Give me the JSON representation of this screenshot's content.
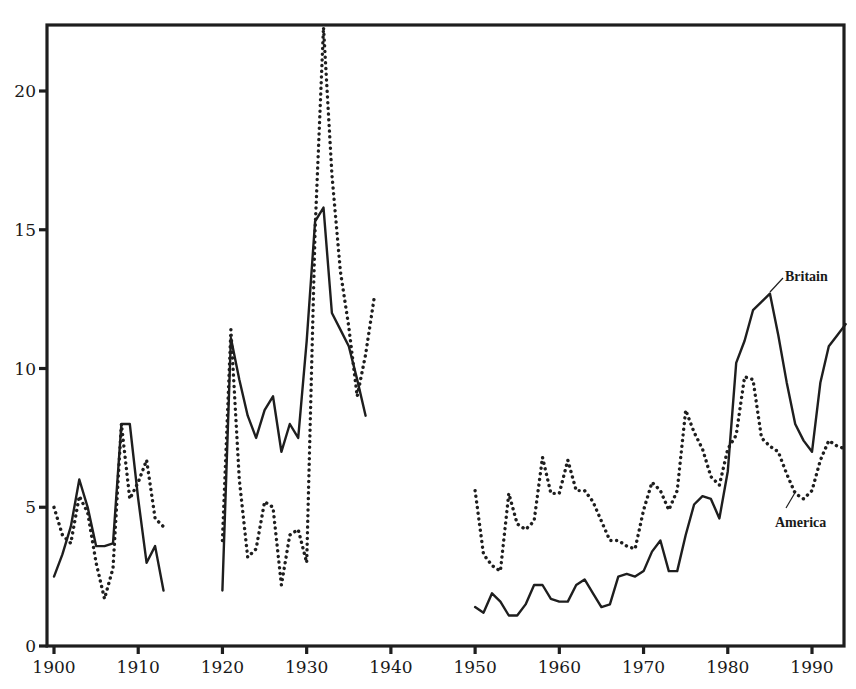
{
  "chart_data": {
    "type": "line",
    "title": "",
    "xlabel": "",
    "ylabel": "",
    "xlim": [
      1900,
      1994
    ],
    "ylim": [
      0,
      22.4
    ],
    "grid": false,
    "legend_position": "inline labels at right",
    "x_ticks": [
      1900,
      1910,
      1920,
      1930,
      1940,
      1950,
      1960,
      1970,
      1980,
      1990
    ],
    "x_tick_labels": [
      "1900",
      "1910",
      "1920",
      "1930",
      "1940",
      "1950",
      "1960",
      "1970",
      "1980",
      "1990"
    ],
    "y_ticks": [
      0,
      5,
      10,
      15,
      20
    ],
    "y_tick_labels": [
      "0",
      "5",
      "10",
      "15",
      "20"
    ],
    "series": [
      {
        "name": "Britain",
        "style": "solid",
        "label": "Britain",
        "segments": [
          {
            "x": [
              1900,
              1901,
              1902,
              1903,
              1904,
              1905,
              1906,
              1907,
              1908,
              1909,
              1910,
              1911,
              1912,
              1913
            ],
            "values": [
              2.5,
              3.3,
              4.3,
              6.0,
              5.0,
              3.6,
              3.6,
              3.7,
              8.0,
              8.0,
              5.3,
              3.0,
              3.6,
              2.0
            ]
          },
          {
            "x": [
              1920,
              1921,
              1922,
              1923,
              1924,
              1925,
              1926,
              1927,
              1928,
              1929,
              1930,
              1931,
              1932,
              1933,
              1934,
              1935,
              1936,
              1937
            ],
            "values": [
              2.0,
              11.1,
              9.6,
              8.3,
              7.5,
              8.5,
              9.0,
              7.0,
              8.0,
              7.5,
              11.0,
              15.3,
              15.8,
              12.0,
              11.4,
              10.8,
              9.6,
              8.3
            ]
          },
          {
            "x": [
              1950,
              1951,
              1952,
              1953,
              1954,
              1955,
              1956,
              1957,
              1958,
              1959,
              1960,
              1961,
              1962,
              1963,
              1964,
              1965,
              1966,
              1967,
              1968,
              1969,
              1970,
              1971,
              1972,
              1973,
              1974,
              1975,
              1976,
              1977,
              1978,
              1979,
              1980,
              1981,
              1982,
              1983,
              1984,
              1985,
              1986,
              1987,
              1988,
              1989,
              1990,
              1991,
              1992,
              1993,
              1994
            ],
            "values": [
              1.4,
              1.2,
              1.9,
              1.6,
              1.1,
              1.1,
              1.5,
              2.2,
              2.2,
              1.7,
              1.6,
              1.6,
              2.2,
              2.4,
              1.9,
              1.4,
              1.5,
              2.5,
              2.6,
              2.5,
              2.7,
              3.4,
              3.8,
              2.7,
              2.7,
              4.0,
              5.1,
              5.4,
              5.3,
              4.6,
              6.3,
              10.2,
              11.0,
              12.1,
              12.4,
              12.7,
              11.2,
              9.5,
              8.0,
              7.4,
              7.0,
              9.5,
              10.8,
              11.2,
              11.6
            ]
          }
        ]
      },
      {
        "name": "America",
        "style": "dotted",
        "label": "America",
        "segments": [
          {
            "x": [
              1900,
              1901,
              1902,
              1903,
              1904,
              1905,
              1906,
              1907,
              1908,
              1909,
              1910,
              1911,
              1912,
              1913
            ],
            "values": [
              5.0,
              4.0,
              3.7,
              5.4,
              4.8,
              3.0,
              1.7,
              2.8,
              8.0,
              5.3,
              5.9,
              6.7,
              4.6,
              4.3
            ]
          },
          {
            "x": [
              1920,
              1921,
              1922,
              1923,
              1924,
              1925,
              1926,
              1927,
              1928,
              1929,
              1930,
              1931,
              1932,
              1933,
              1934,
              1935,
              1936,
              1937,
              1938
            ],
            "values": [
              3.8,
              11.4,
              6.0,
              3.2,
              3.5,
              5.2,
              5.0,
              2.2,
              4.0,
              4.2,
              3.0,
              15.0,
              22.3,
              17.0,
              13.5,
              11.5,
              9.0,
              10.5,
              12.5
            ]
          },
          {
            "x": [
              1950,
              1951,
              1952,
              1953,
              1954,
              1955,
              1956,
              1957,
              1958,
              1959,
              1960,
              1961,
              1962,
              1963,
              1964,
              1965,
              1966,
              1967,
              1968,
              1969,
              1970,
              1971,
              1972,
              1973,
              1974,
              1975,
              1976,
              1977,
              1978,
              1979,
              1980,
              1981,
              1982,
              1983,
              1984,
              1985,
              1986,
              1987,
              1988,
              1989,
              1990,
              1991,
              1992,
              1993,
              1994
            ],
            "values": [
              5.6,
              3.3,
              2.9,
              2.7,
              5.5,
              4.4,
              4.2,
              4.5,
              6.8,
              5.5,
              5.5,
              6.7,
              5.6,
              5.6,
              5.2,
              4.5,
              3.8,
              3.8,
              3.6,
              3.5,
              4.9,
              5.9,
              5.6,
              4.9,
              5.6,
              8.5,
              7.7,
              7.1,
              6.1,
              5.8,
              7.1,
              7.6,
              9.7,
              9.6,
              7.5,
              7.2,
              7.0,
              6.2,
              5.5,
              5.3,
              5.6,
              6.7,
              7.4,
              7.2,
              7.1
            ]
          }
        ]
      }
    ],
    "annotations": [
      {
        "text": "Britain",
        "target_series": "Britain",
        "anchor_x": 1985,
        "anchor_y": 12.7
      },
      {
        "text": "America",
        "target_series": "America",
        "anchor_x": 1989,
        "anchor_y": 5.3
      }
    ]
  },
  "labels": {
    "britain": "Britain",
    "america": "America"
  },
  "colors": {
    "ink": "#1e1e1e",
    "background": "#ffffff"
  }
}
